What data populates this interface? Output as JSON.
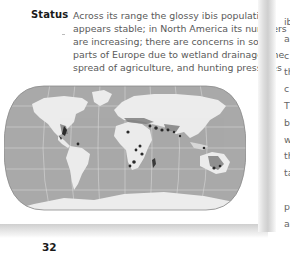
{
  "left_page": {
    "status": {
      "label": "Status",
      "lines": [
        "Across its range the glossy ibis population",
        "appears stable; in North America its numbers",
        "are increasing; there are concerns in some",
        "parts of Europe due to wetland drainage, the",
        "spread of agriculture, and hunting pressures"
      ]
    },
    "map": {
      "name": "world-distribution-map",
      "ocean_color": "#a9a9a9",
      "land_color": "#ececec",
      "range_color": "#7f7f7f",
      "breeding_color": "#2a2a2a",
      "graticule_color": "#d6d6d6"
    },
    "page_number": "32"
  },
  "right_page": {
    "line_fragments": [
      "ib",
      "a",
      "c",
      "th",
      "c",
      "T",
      "b",
      "w",
      "th",
      "ta",
      "",
      "p",
      "a"
    ]
  }
}
